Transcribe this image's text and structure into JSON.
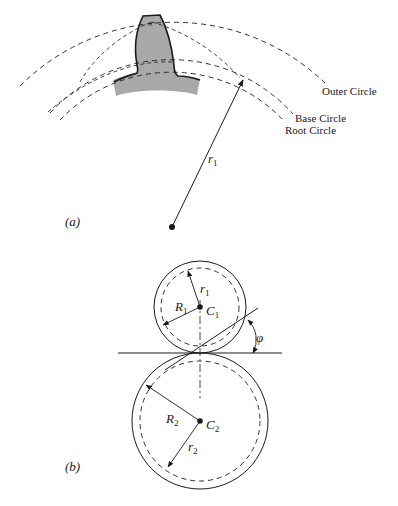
{
  "figure_a": {
    "caption": "(a)",
    "labels": {
      "outer_circle": "Outer Circle",
      "base_circle": "Base Circle",
      "root_circle": "Root Circle",
      "radius": "r",
      "radius_sub": "1"
    }
  },
  "figure_b": {
    "caption": "(b)",
    "labels": {
      "R1": "R",
      "R1_sub": "1",
      "r1": "r",
      "r1_sub": "1",
      "C1": "C",
      "C1_sub": "1",
      "R2": "R",
      "R2_sub": "2",
      "r2": "r",
      "r2_sub": "2",
      "C2": "C",
      "C2_sub": "2",
      "phi": "φ"
    }
  },
  "colors": {
    "ink": "#1a1a1a",
    "tooth_fill": "#a9a9a9"
  }
}
